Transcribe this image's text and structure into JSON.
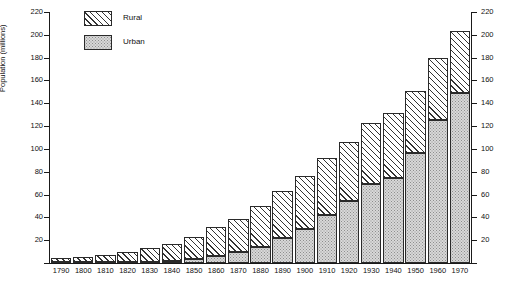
{
  "chart_data": {
    "type": "bar",
    "subtype": "stacked-bar",
    "title": "",
    "xlabel": "",
    "ylabel": "Population (millions)",
    "ylim": [
      0,
      220
    ],
    "ytick_step": 20,
    "yticks": [
      0,
      20,
      40,
      60,
      80,
      100,
      120,
      140,
      160,
      180,
      200,
      220
    ],
    "ytick_labels": [
      "",
      "20",
      "40",
      "60",
      "80",
      "100",
      "120",
      "140",
      "160",
      "180",
      "200",
      "220"
    ],
    "dual_axis": true,
    "right_axis_same_scale": true,
    "grid": false,
    "legend_position": "top-left",
    "categories": [
      "1790",
      "1800",
      "1810",
      "1820",
      "1830",
      "1840",
      "1850",
      "1860",
      "1870",
      "1880",
      "1890",
      "1900",
      "1910",
      "1920",
      "1930",
      "1940",
      "1950",
      "1960",
      "1970"
    ],
    "series": [
      {
        "name": "Urban",
        "fill": "stippled",
        "color": "#d8d8d8",
        "values": [
          0.2,
          0.3,
          0.5,
          0.7,
          1.1,
          1.8,
          3.5,
          6.2,
          9.9,
          14.1,
          22.1,
          30.2,
          42.0,
          54.2,
          69.0,
          74.4,
          96.5,
          125.3,
          149.3
        ]
      },
      {
        "name": "Rural",
        "fill": "hatched",
        "color": "#ffffff",
        "values": [
          3.7,
          4.9,
          6.7,
          8.9,
          11.7,
          15.2,
          19.6,
          25.2,
          28.7,
          36.0,
          40.8,
          45.8,
          50.0,
          51.6,
          53.8,
          57.2,
          54.2,
          54.0,
          53.9
        ]
      }
    ],
    "totals": [
      3.9,
      5.2,
      7.2,
      9.6,
      12.8,
      17.0,
      23.1,
      31.4,
      38.6,
      50.1,
      62.9,
      76.0,
      92.0,
      105.8,
      122.8,
      131.6,
      150.7,
      179.3,
      203.2
    ]
  },
  "legend": {
    "items": [
      {
        "label": "Rural"
      },
      {
        "label": "Urban"
      }
    ]
  }
}
